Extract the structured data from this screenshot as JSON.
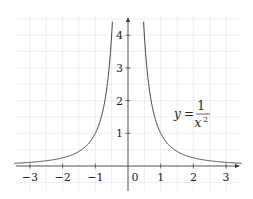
{
  "chart_data": {
    "type": "line",
    "title": "",
    "function": "y = 1/x^2",
    "annotation": {
      "text_lhs": "y",
      "text_eq": "=",
      "numerator": "1",
      "denominator": "x",
      "exponent": "2"
    },
    "xlabel": "",
    "ylabel": "",
    "xlim": [
      -3.4,
      3.4
    ],
    "ylim": [
      -0.75,
      4.5
    ],
    "x_ticks": [
      -3,
      -2,
      -1,
      0,
      1,
      2,
      3
    ],
    "x_tick_labels": [
      "−3",
      "−2",
      "−1",
      "0",
      "1",
      "2",
      "3"
    ],
    "y_ticks": [
      1,
      2,
      3,
      4
    ],
    "y_tick_labels": [
      "1",
      "2",
      "3",
      "4"
    ],
    "grid": true,
    "grid_step": 0.5,
    "legend": null,
    "series": [
      {
        "name": "y = 1/x^2",
        "x": [
          -3.4,
          -3,
          -2.5,
          -2,
          -1.5,
          -1,
          -0.75,
          -0.6,
          -0.5,
          -0.48
        ],
        "y": [
          0.087,
          0.111,
          0.16,
          0.25,
          0.444,
          1,
          1.778,
          2.778,
          4,
          4.34
        ]
      },
      {
        "name": "y = 1/x^2",
        "x": [
          0.48,
          0.5,
          0.6,
          0.75,
          1,
          1.5,
          2,
          2.5,
          3,
          3.4
        ],
        "y": [
          4.34,
          4,
          2.778,
          1.778,
          1,
          0.444,
          0.25,
          0.16,
          0.111,
          0.087
        ]
      }
    ]
  },
  "colors": {
    "curve": "#333333",
    "axis": "#333333",
    "grid": "#e6e6e6"
  }
}
